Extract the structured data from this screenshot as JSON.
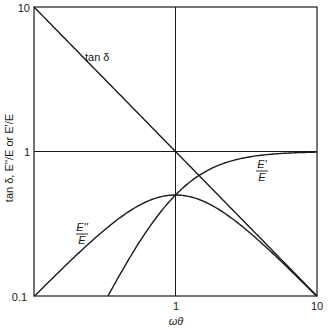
{
  "chart_data": {
    "type": "line",
    "title": "",
    "xlabel": "ωθ",
    "ylabel": "tan δ, E''/E or E'/E",
    "xscale": "log",
    "yscale": "log",
    "xlim": [
      0.1,
      10
    ],
    "ylim": [
      0.1,
      10
    ],
    "x_ticks": [
      "0.1",
      "1",
      "10"
    ],
    "y_ticks": [
      "0.1",
      "1",
      "10"
    ],
    "grid": "lines at x=1 and y=1",
    "legend": "none; curves labeled inline",
    "series": [
      {
        "name": "tan δ",
        "label": "tan δ",
        "x": [
          0.1,
          0.2,
          0.5,
          1,
          2,
          5,
          10
        ],
        "values": [
          10,
          5,
          2,
          1,
          0.5,
          0.2,
          0.1
        ]
      },
      {
        "name": "E'/E",
        "label_num": "E'",
        "label_den": "E",
        "x": [
          0.33,
          0.5,
          0.7,
          1,
          1.5,
          2,
          3,
          5,
          10
        ],
        "values": [
          0.1,
          0.2,
          0.33,
          0.5,
          0.69,
          0.8,
          0.9,
          0.96,
          0.99
        ]
      },
      {
        "name": "E''/E",
        "label_num": "E''",
        "label_den": "E",
        "x": [
          0.1,
          0.2,
          0.3,
          0.5,
          0.7,
          1,
          1.5,
          2,
          3,
          5,
          10
        ],
        "values": [
          0.099,
          0.19,
          0.28,
          0.4,
          0.47,
          0.5,
          0.46,
          0.4,
          0.3,
          0.19,
          0.099
        ]
      }
    ]
  },
  "labels": {
    "y_tick_top": "10",
    "y_tick_mid": "1",
    "y_tick_bottom": "0.1",
    "x_tick_left": "0.1",
    "x_tick_mid": "1",
    "x_tick_right": "10",
    "x_axis_title": "ωθ",
    "y_axis_title": "tan δ, E''/E or E'/E",
    "tan_label": "tan δ",
    "e_prime_num": "E'",
    "e_prime_den": "E",
    "e_dprime_num": "E''",
    "e_dprime_den": "E"
  },
  "colors": {
    "ink": "#1a1a1a",
    "background": "#ffffff"
  }
}
